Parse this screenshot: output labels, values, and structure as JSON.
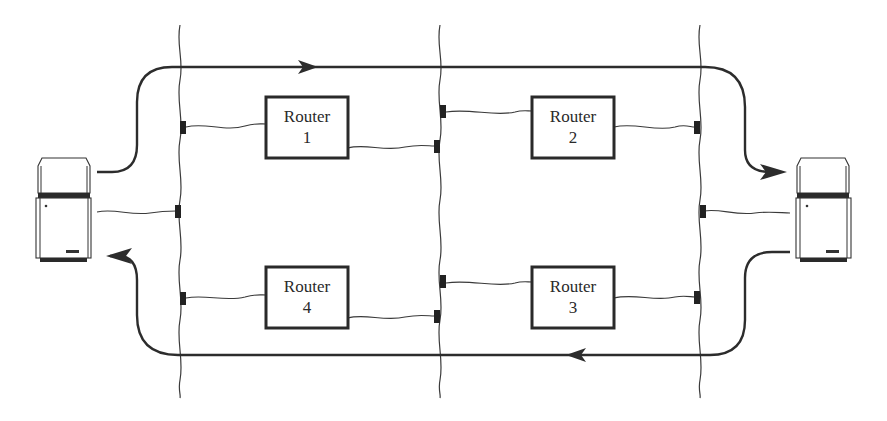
{
  "diagram": {
    "colors": {
      "ink": "#2a2a2a",
      "background": "#ffffff"
    },
    "networks": [
      {
        "id": "net-left",
        "x": 180
      },
      {
        "id": "net-middle",
        "x": 440
      },
      {
        "id": "net-right",
        "x": 700
      }
    ],
    "routers": [
      {
        "id": "router-1",
        "label": "Router",
        "number": "1",
        "x": 266,
        "y": 97
      },
      {
        "id": "router-2",
        "label": "Router",
        "number": "2",
        "x": 532,
        "y": 97
      },
      {
        "id": "router-3",
        "label": "Router",
        "number": "3",
        "x": 532,
        "y": 267
      },
      {
        "id": "router-4",
        "label": "Router",
        "number": "4",
        "x": 266,
        "y": 267
      }
    ],
    "hosts": [
      {
        "id": "host-left",
        "position": "left"
      },
      {
        "id": "host-right",
        "position": "right"
      }
    ],
    "paths": [
      {
        "id": "forward-path",
        "direction": "left-to-right",
        "via": [
          "Router 1",
          "Router 2"
        ]
      },
      {
        "id": "return-path",
        "direction": "right-to-left",
        "via": [
          "Router 3",
          "Router 4"
        ]
      }
    ]
  }
}
